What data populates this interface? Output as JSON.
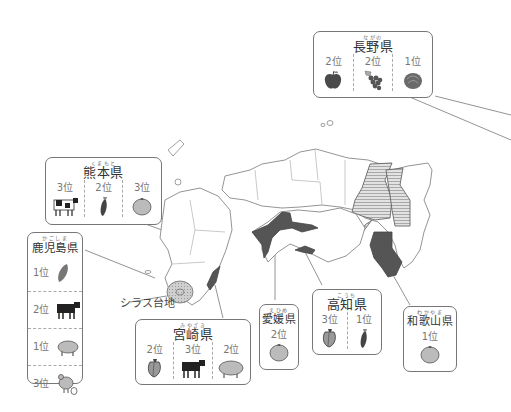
{
  "figure": {
    "type": "regional-agriculture-map",
    "shirasu_label": "シラス台地",
    "colors": {
      "highlight_dark": "#555555",
      "highlight_hatched": "#cfcfcf",
      "border": "#777777",
      "rank_text": "#777777"
    }
  },
  "callouts": {
    "nagano": {
      "ruby": "ながの",
      "name": "長野県",
      "items": [
        {
          "rank": "2位",
          "product": "apple",
          "icon": "apple-icon"
        },
        {
          "rank": "2位",
          "product": "grape",
          "icon": "grape-icon"
        },
        {
          "rank": "1位",
          "product": "lettuce",
          "icon": "lettuce-icon"
        }
      ]
    },
    "kumamoto": {
      "ruby": "くまもと",
      "name": "熊本県",
      "items": [
        {
          "rank": "3位",
          "product": "dairy-cow",
          "icon": "dairy-cow-icon"
        },
        {
          "rank": "2位",
          "product": "eggplant",
          "icon": "eggplant-icon"
        },
        {
          "rank": "3位",
          "product": "mandarin",
          "icon": "mandarin-icon"
        }
      ]
    },
    "kagoshima": {
      "ruby": "かごしま",
      "name": "鹿児島県",
      "items": [
        {
          "rank": "1位",
          "product": "sweet-potato",
          "icon": "sweet-potato-icon"
        },
        {
          "rank": "2位",
          "product": "beef-cattle",
          "icon": "beef-cattle-icon"
        },
        {
          "rank": "1位",
          "product": "pig",
          "icon": "pig-icon"
        },
        {
          "rank": "3位",
          "product": "chicken",
          "icon": "chicken-icon"
        }
      ]
    },
    "miyazaki": {
      "ruby": "みやざき",
      "name": "宮崎県",
      "items": [
        {
          "rank": "2位",
          "product": "green-pepper",
          "icon": "green-pepper-icon"
        },
        {
          "rank": "3位",
          "product": "beef-cattle",
          "icon": "beef-cattle-icon"
        },
        {
          "rank": "2位",
          "product": "pig",
          "icon": "pig-icon"
        }
      ]
    },
    "ehime": {
      "ruby": "えひめ",
      "name": "愛媛県",
      "items": [
        {
          "rank": "2位",
          "product": "mandarin",
          "icon": "mandarin-icon"
        }
      ]
    },
    "kochi": {
      "ruby": "こうち",
      "name": "高知県",
      "items": [
        {
          "rank": "3位",
          "product": "green-pepper",
          "icon": "green-pepper-icon"
        },
        {
          "rank": "1位",
          "product": "eggplant",
          "icon": "eggplant-icon"
        }
      ]
    },
    "wakayama": {
      "ruby": "わかやま",
      "name": "和歌山県",
      "items": [
        {
          "rank": "1位",
          "product": "mandarin",
          "icon": "mandarin-icon"
        }
      ]
    }
  }
}
